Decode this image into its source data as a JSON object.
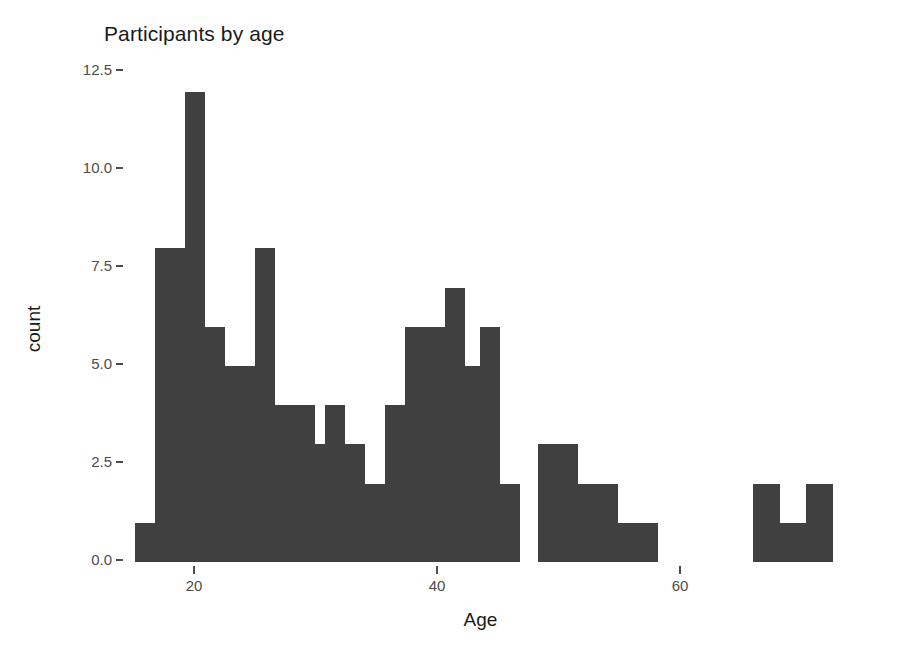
{
  "chart_data": {
    "type": "bar",
    "title": "Participants by age",
    "xlabel": "Age",
    "ylabel": "count",
    "grid": false,
    "legend": null,
    "xlim": [
      14.2,
      72.5
    ],
    "ylim": [
      0,
      12.5
    ],
    "xticks": [
      20,
      40,
      60
    ],
    "xtick_labels": [
      "20",
      "40",
      "60"
    ],
    "yticks": [
      0.0,
      2.5,
      5.0,
      7.5,
      10.0,
      12.5
    ],
    "ytick_labels": [
      "0.0",
      "2.5",
      "5.0",
      "7.5",
      "10.0",
      "12.5"
    ],
    "bin_width": 1.65,
    "bar_color": "#404040",
    "categories": [
      "15.1",
      "16.8",
      "18.4",
      "20.1",
      "21.7",
      "23.4",
      "25.0",
      "26.7",
      "28.3",
      "30.0",
      "31.6",
      "33.3",
      "34.9",
      "36.6",
      "38.2",
      "39.9",
      "41.5",
      "43.2",
      "44.8",
      "46.5",
      "48.1",
      "49.8",
      "51.4",
      "53.1",
      "54.7",
      "56.4",
      "58.0",
      "59.7",
      "61.3",
      "63.0",
      "64.6",
      "66.3",
      "67.9",
      "69.6",
      "71.2"
    ],
    "values": [
      1,
      8,
      8,
      12,
      6,
      5,
      5,
      8,
      4,
      4,
      3,
      4,
      3,
      2,
      4,
      6,
      6,
      7,
      5,
      6,
      2,
      0,
      3,
      2,
      2,
      1,
      1,
      0,
      0,
      0,
      2,
      2,
      1,
      2,
      2
    ],
    "bars": [
      {
        "x": 10,
        "w": 20,
        "count": 1
      },
      {
        "x": 30,
        "w": 20,
        "count": 8
      },
      {
        "x": 50,
        "w": 20,
        "count": 8
      },
      {
        "x": 60,
        "w": 20,
        "count": 12
      },
      {
        "x": 80,
        "w": 20,
        "count": 6
      },
      {
        "x": 100,
        "w": 20,
        "count": 5
      },
      {
        "x": 120,
        "w": 20,
        "count": 5
      },
      {
        "x": 130,
        "w": 20,
        "count": 8
      },
      {
        "x": 150,
        "w": 20,
        "count": 4
      },
      {
        "x": 170,
        "w": 20,
        "count": 4
      },
      {
        "x": 180,
        "w": 20,
        "count": 3
      },
      {
        "x": 200,
        "w": 20,
        "count": 4
      },
      {
        "x": 220,
        "w": 20,
        "count": 3
      },
      {
        "x": 240,
        "w": 20,
        "count": 2
      },
      {
        "x": 260,
        "w": 20,
        "count": 4
      },
      {
        "x": 280,
        "w": 20,
        "count": 6
      },
      {
        "x": 300,
        "w": 20,
        "count": 6
      },
      {
        "x": 320,
        "w": 20,
        "count": 7
      },
      {
        "x": 340,
        "w": 20,
        "count": 5
      },
      {
        "x": 355,
        "w": 20,
        "count": 6
      },
      {
        "x": 375,
        "w": 20,
        "count": 2
      },
      {
        "x": 413,
        "w": 40,
        "count": 3
      },
      {
        "x": 453,
        "w": 40,
        "count": 2
      },
      {
        "x": 493,
        "w": 40,
        "count": 1
      },
      {
        "x": 628,
        "w": 27,
        "count": 2
      },
      {
        "x": 655,
        "w": 26,
        "count": 1
      },
      {
        "x": 681,
        "w": 27,
        "count": 2
      }
    ]
  }
}
